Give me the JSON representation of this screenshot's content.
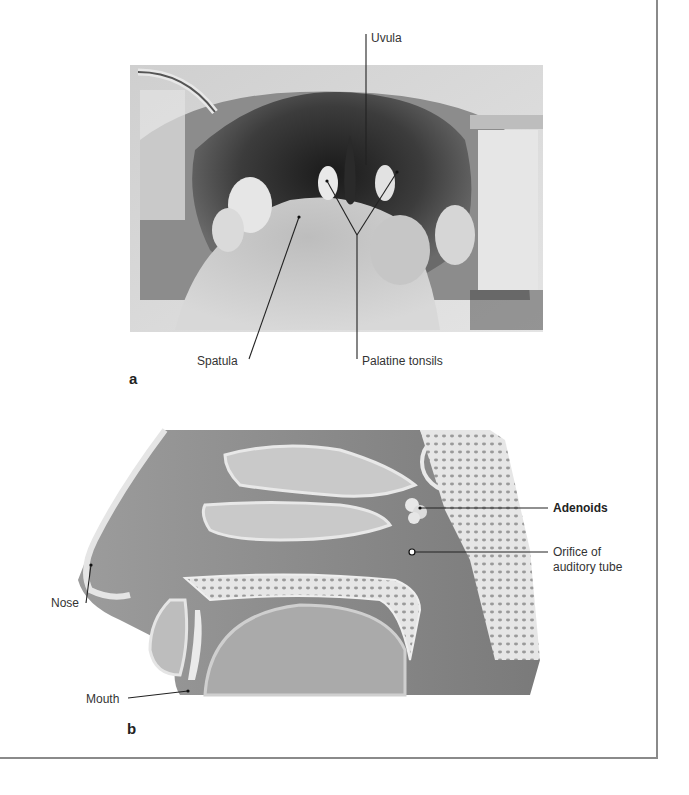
{
  "figure": {
    "panel_a": {
      "letter": "a",
      "image": "photograph-open-mouth-throat",
      "labels": {
        "uvula": "Uvula",
        "spatula": "Spatula",
        "palatine_tonsils": "Palatine tonsils"
      }
    },
    "panel_b": {
      "letter": "b",
      "image": "sagittal-section-nasopharynx-illustration",
      "labels": {
        "adenoids": "Adenoids",
        "orifice_line1": "Orifice of",
        "orifice_line2": "auditory tube",
        "nose": "Nose",
        "mouth": "Mouth"
      }
    }
  },
  "colors": {
    "frame": "#8a8a8a",
    "leader_line": "#222222",
    "text": "#333333"
  }
}
